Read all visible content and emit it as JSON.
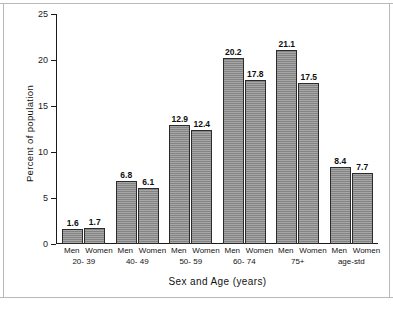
{
  "chart_data": {
    "type": "bar",
    "title": "",
    "xlabel": "Sex and Age (years)",
    "ylabel": "Percent of population",
    "ylim": [
      0,
      25
    ],
    "yticks": [
      0,
      5,
      10,
      15,
      20,
      25
    ],
    "ytick_labels": [
      "0",
      "5",
      "10",
      "15",
      "20",
      "25"
    ],
    "grid": false,
    "legend": "none",
    "categories": [
      "20- 39",
      "40- 49",
      "50- 59",
      "60- 74",
      "75+",
      "age-std"
    ],
    "series": [
      {
        "name": "Men",
        "values": [
          1.6,
          6.8,
          12.9,
          20.2,
          21.1,
          8.4
        ]
      },
      {
        "name": "Women",
        "values": [
          1.7,
          6.1,
          12.4,
          17.8,
          17.5,
          7.7
        ]
      }
    ],
    "groups": [
      {
        "age": "20- 39",
        "bars": [
          {
            "sex": "Men",
            "value": 1.6,
            "label": "1.6"
          },
          {
            "sex": "Women",
            "value": 1.7,
            "label": "1.7"
          }
        ]
      },
      {
        "age": "40- 49",
        "bars": [
          {
            "sex": "Men",
            "value": 6.8,
            "label": "6.8"
          },
          {
            "sex": "Women",
            "value": 6.1,
            "label": "6.1"
          }
        ]
      },
      {
        "age": "50- 59",
        "bars": [
          {
            "sex": "Men",
            "value": 12.9,
            "label": "12.9"
          },
          {
            "sex": "Women",
            "value": 12.4,
            "label": "12.4"
          }
        ]
      },
      {
        "age": "60- 74",
        "bars": [
          {
            "sex": "Men",
            "value": 20.2,
            "label": "20.2"
          },
          {
            "sex": "Women",
            "value": 17.8,
            "label": "17.8"
          }
        ]
      },
      {
        "age": "75+",
        "bars": [
          {
            "sex": "Men",
            "value": 21.1,
            "label": "21.1"
          },
          {
            "sex": "Women",
            "value": 17.5,
            "label": "17.5"
          }
        ]
      },
      {
        "age": "age-std",
        "bars": [
          {
            "sex": "Men",
            "value": 8.4,
            "label": "8.4"
          },
          {
            "sex": "Women",
            "value": 7.7,
            "label": "7.7"
          }
        ]
      }
    ],
    "colors": {
      "bar_fill": "#8e8e8e",
      "bar_border": "#2b2b2b",
      "axis": "#1a1a1a",
      "text": "#111111",
      "background": "#ffffff",
      "frame": "#b9b9b9"
    }
  }
}
